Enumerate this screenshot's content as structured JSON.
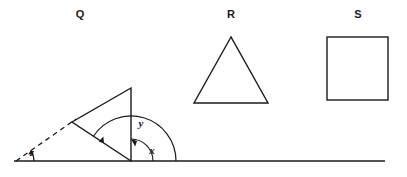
{
  "figure": {
    "title": "",
    "background_color": "#ffffff",
    "stroke_color": "#1a1a1a",
    "width": 407,
    "height": 177,
    "baseline": {
      "name": "horizontal-ground-line",
      "x1": 14,
      "y1": 161,
      "x2": 385,
      "y2": 161
    },
    "shapes": [
      {
        "key": "Q",
        "label": "Q",
        "type": "triangle",
        "label_x": 80,
        "label_y": 15,
        "points": "131,88 72,122 131,161",
        "description": "right triangle resting on the ground line"
      },
      {
        "key": "R",
        "label": "R",
        "type": "triangle",
        "label_x": 231,
        "label_y": 15,
        "points": "231,37 194,103 268,103",
        "description": "equilateral-looking triangle"
      },
      {
        "key": "S",
        "label": "S",
        "type": "square",
        "label_x": 358,
        "label_y": 15,
        "x": 327,
        "y": 37,
        "w": 61,
        "h": 63,
        "description": "square"
      }
    ],
    "construction_line": {
      "name": "dashed-extension-line",
      "x1": 16,
      "y1": 161,
      "x2": 76,
      "y2": 119,
      "style": "dashed"
    },
    "angles": [
      {
        "key": "x",
        "label": "x",
        "label_x": 152,
        "label_y": 151,
        "vertex_x": 131,
        "vertex_y": 161,
        "radius": 22,
        "start_deg": 0,
        "end_deg": 90,
        "arrow_at": "end",
        "description": "angle between ground line and vertical side of Q"
      },
      {
        "key": "y",
        "label": "y",
        "label_x": 141,
        "label_y": 124,
        "vertex_x": 131,
        "vertex_y": 161,
        "radius": 45,
        "start_deg": 0,
        "end_deg": 147,
        "arrow_at": "end",
        "description": "angle between ground line and slanted side of Q"
      },
      {
        "key": "z",
        "label": "z",
        "label_x": 32,
        "label_y": 153,
        "vertex_x": 16,
        "vertex_y": 161,
        "radius": 18,
        "start_deg": 0,
        "end_deg": 35,
        "arrow_at": "end",
        "description": "angle between ground line and dashed extension line"
      }
    ]
  }
}
